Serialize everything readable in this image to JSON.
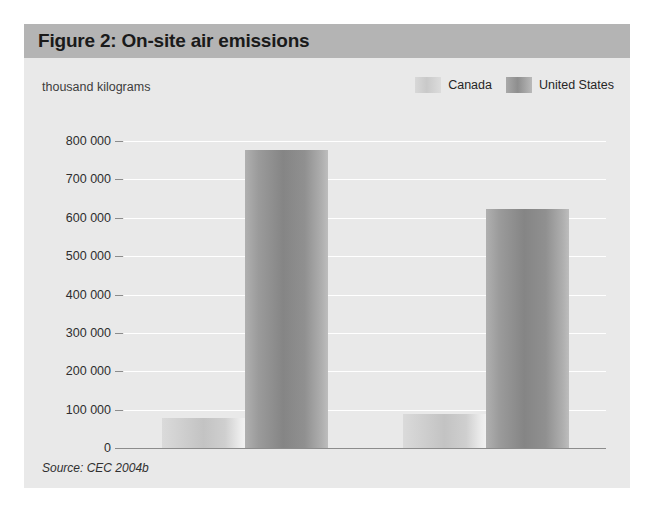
{
  "figure": {
    "title": "Figure 2: On-site air emissions",
    "source": "Source: CEC 2004b"
  },
  "legend": {
    "items": [
      {
        "label": "Canada",
        "swatch": "legend-swatch-canada",
        "color": "#c9c9c9"
      },
      {
        "label": "United States",
        "swatch": "legend-swatch-united-states",
        "color": "#8e8e8e"
      }
    ]
  },
  "chart_data": {
    "type": "bar",
    "title": "Figure 2: On-site air emissions",
    "subtitle": "",
    "xlabel": "",
    "ylabel": "thousand kilograms",
    "categories": [
      "1998",
      "2001"
    ],
    "series": [
      {
        "name": "Canada",
        "values": [
          78000,
          88000
        ],
        "color": "#c9c9c9"
      },
      {
        "name": "United States",
        "values": [
          777000,
          623000
        ],
        "color": "#8e8e8e"
      }
    ],
    "ylim": [
      0,
      800000
    ],
    "ytick_values": [
      0,
      100000,
      200000,
      300000,
      400000,
      500000,
      600000,
      700000,
      800000
    ],
    "ytick_labels": [
      "0",
      "100 000",
      "200 000",
      "300 000",
      "400 000",
      "500 000",
      "600 000",
      "700 000",
      "800 000"
    ],
    "grid": true,
    "grid_color": "#ffffff",
    "legend_position": "top-right",
    "annotations": [
      "Source: CEC 2004b"
    ],
    "plot_background": "#e9e9e9"
  }
}
